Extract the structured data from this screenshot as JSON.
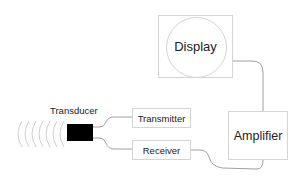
{
  "diagram": {
    "nodes": {
      "transducer": {
        "label": "Transducer",
        "fill": "#000000"
      },
      "transmitter": {
        "label": "Transmitter"
      },
      "receiver": {
        "label": "Receiver"
      },
      "amplifier": {
        "label": "Amplifier"
      },
      "display": {
        "label": "Display"
      }
    },
    "edges": [
      {
        "from": "transducer",
        "to": "transmitter"
      },
      {
        "from": "transducer",
        "to": "receiver"
      },
      {
        "from": "receiver",
        "to": "amplifier"
      },
      {
        "from": "amplifier",
        "to": "display"
      }
    ],
    "colors": {
      "wire": "#888888",
      "border": "#d4d4d4",
      "wave": "#cccccc",
      "text": "#222222"
    }
  }
}
